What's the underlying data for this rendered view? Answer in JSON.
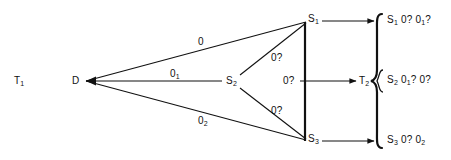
{
  "figure": {
    "title_label": "T",
    "title_sub": "1",
    "background": "#ffffff",
    "stroke": "#111111"
  },
  "nodes": {
    "source": {
      "label": "D",
      "sub": "",
      "x": 78,
      "y": 81
    },
    "s1": {
      "label": "S",
      "sub": "1",
      "x": 309,
      "y": 21
    },
    "s2": {
      "label": "S",
      "sub": "2",
      "x": 230,
      "y": 81
    },
    "s3": {
      "label": "S",
      "sub": "3",
      "x": 309,
      "y": 141
    },
    "t2": {
      "label": "T",
      "sub": "2",
      "x": 366,
      "y": 81
    }
  },
  "edges": [
    {
      "name": "d-to-s1",
      "label": "0",
      "sub": "",
      "x": 198,
      "y": 41
    },
    {
      "name": "d-to-s2",
      "label": "0",
      "sub": "1",
      "x": 172,
      "y": 73
    },
    {
      "name": "d-to-s3",
      "label": "0",
      "sub": "2",
      "x": 200,
      "y": 120
    },
    {
      "name": "s2-to-s1",
      "label": "0?",
      "sub": "",
      "x": 272,
      "y": 57
    },
    {
      "name": "s2-to-s3",
      "label": "0?",
      "sub": "",
      "x": 272,
      "y": 110
    },
    {
      "name": "brace-mid",
      "label": "0?",
      "sub": "",
      "x": 285,
      "y": 77
    }
  ],
  "outputs": [
    {
      "name": "output-s1",
      "label": "S",
      "sub": "1",
      "text": "0? 0",
      "sub2": "1",
      "tail": "?",
      "x": 390,
      "y": 16
    },
    {
      "name": "output-s2",
      "label": "S",
      "sub": "2",
      "text": "0",
      "sub2": "1",
      "tail": "? 0?",
      "x": 390,
      "y": 76
    },
    {
      "name": "output-s3",
      "label": "S",
      "sub": "3",
      "text": "0? 0",
      "sub2": "2",
      "tail": "",
      "x": 390,
      "y": 136
    }
  ],
  "left_title": {
    "label": "T",
    "sub": "1",
    "x": 14,
    "y": 75
  }
}
